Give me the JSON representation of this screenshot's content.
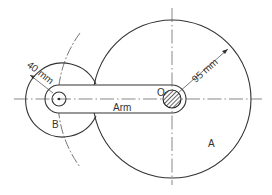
{
  "diagram": {
    "labels": {
      "arm": "Arm",
      "pivot": "O",
      "gear_a": "A",
      "gear_b": "B"
    },
    "dimensions": {
      "radius_a": "95 mm",
      "radius_b": "40 mm"
    }
  }
}
